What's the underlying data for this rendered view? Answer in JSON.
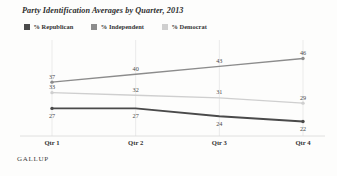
{
  "title": "Party Identification Averages by Quarter, 2013",
  "source": "GALLUP",
  "legend": {
    "items": [
      {
        "label": "% Republican",
        "color": "#4a4a4a"
      },
      {
        "label": "% Independent",
        "color": "#8c8c8c"
      },
      {
        "label": "% Democrat",
        "color": "#cfcfcf"
      }
    ]
  },
  "axis": {
    "ticks": [
      "Qtr 1",
      "Qtr 2",
      "Qtr 3",
      "Qtr 4"
    ]
  },
  "chart_data": {
    "type": "line",
    "title": "Party Identification Averages by Quarter, 2013",
    "xlabel": "",
    "ylabel": "",
    "categories": [
      "Qtr 1",
      "Qtr 2",
      "Qtr 3",
      "Qtr 4"
    ],
    "ylim": [
      18,
      50
    ],
    "grid": "vertical",
    "legend_position": "top-left",
    "series": [
      {
        "name": "% Independent",
        "color": "#8c8c8c",
        "values": [
          37,
          40,
          43,
          46
        ]
      },
      {
        "name": "% Democrat",
        "color": "#cfcfcf",
        "values": [
          33,
          32,
          31,
          29
        ]
      },
      {
        "name": "% Republican",
        "color": "#4a4a4a",
        "values": [
          27,
          27,
          24,
          22
        ]
      }
    ],
    "labels": {
      "independent": [
        "37",
        "40",
        "43",
        "46"
      ],
      "democrat": [
        "33",
        "32",
        "31",
        "29"
      ],
      "republican": [
        "27",
        "27",
        "24",
        "22"
      ]
    }
  }
}
